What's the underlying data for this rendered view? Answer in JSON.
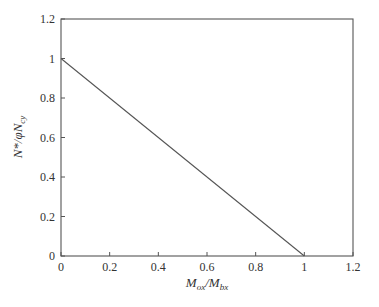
{
  "chart_data": {
    "type": "line",
    "title": "",
    "xlabel": "M_ox/M_bx",
    "ylabel": "N*/φN_cy",
    "xlim": [
      0,
      1.2
    ],
    "ylim": [
      0,
      1.2
    ],
    "grid": false,
    "legend": null,
    "x_ticks": [
      "0",
      "0.2",
      "0.4",
      "0.6",
      "0.8",
      "1",
      "1.2"
    ],
    "y_ticks": [
      "0",
      "0.2",
      "0.4",
      "0.6",
      "0.8",
      "1",
      "1.2"
    ],
    "series": [
      {
        "name": "interaction",
        "x": [
          0,
          1
        ],
        "y": [
          1,
          0
        ],
        "color": "#555555"
      }
    ]
  },
  "labels": {
    "x_main": "M",
    "x_sub1": "ox",
    "x_slash": "/M",
    "x_sub2": "bx",
    "y_main": "N*/φN",
    "y_sub": "cy"
  }
}
